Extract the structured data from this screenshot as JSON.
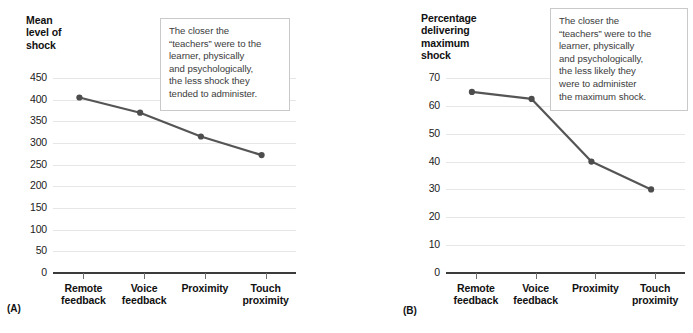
{
  "figure": {
    "panels": [
      {
        "letter": "(A)",
        "y_axis_title": "Mean\nlevel of\nshock",
        "callout": "The closer the\n“teachers” were to the\nlearner, physically\nand psychologically,\nthe less shock they\ntended to administer."
      },
      {
        "letter": "(B)",
        "y_axis_title": "Percentage\ndelivering\nmaximum\nshock",
        "callout": "The closer the\n“teachers” were to the\nlearner, physically\nand psychologically,\nthe less likely they\nwere to administer\nthe maximum shock."
      }
    ]
  },
  "chart_data": [
    {
      "type": "line",
      "panel": "(A)",
      "title": "",
      "xlabel": "",
      "ylabel": "Mean level of shock",
      "categories": [
        "Remote\nfeedback",
        "Voice\nfeedback",
        "Proximity",
        "Touch\nproximity"
      ],
      "category_labels_flat": [
        "Remote feedback",
        "Voice feedback",
        "Proximity",
        "Touch proximity"
      ],
      "values": [
        405,
        370,
        315,
        272
      ],
      "ylim": [
        0,
        450
      ],
      "yticks": [
        0,
        50,
        100,
        150,
        200,
        250,
        300,
        350,
        400,
        450
      ],
      "ytick_labels": [
        "0",
        "50",
        "100",
        "150",
        "200",
        "250",
        "300",
        "350",
        "400",
        "450"
      ],
      "grid": true,
      "legend": "none",
      "line_color": "#555555",
      "marker_color": "#4d4d4d"
    },
    {
      "type": "line",
      "panel": "(B)",
      "title": "",
      "xlabel": "",
      "ylabel": "Percentage delivering maximum shock",
      "categories": [
        "Remote\nfeedback",
        "Voice\nfeedback",
        "Proximity",
        "Touch\nproximity"
      ],
      "category_labels_flat": [
        "Remote feedback",
        "Voice feedback",
        "Proximity",
        "Touch proximity"
      ],
      "values": [
        65,
        62.5,
        40,
        30
      ],
      "ylim": [
        0,
        70
      ],
      "yticks": [
        0,
        10,
        20,
        30,
        40,
        50,
        60,
        70
      ],
      "ytick_labels": [
        "0",
        "10",
        "20",
        "30",
        "40",
        "50",
        "60",
        "70"
      ],
      "grid": true,
      "legend": "none",
      "line_color": "#555555",
      "marker_color": "#4d4d4d"
    }
  ],
  "colors": {
    "line": "#555555",
    "gridline": "#e6e6e6",
    "axis": "#3b3b3b",
    "text": "#1a1a1a",
    "callout_border": "#c9c9c9",
    "callout_text": "#3c3c3c"
  }
}
